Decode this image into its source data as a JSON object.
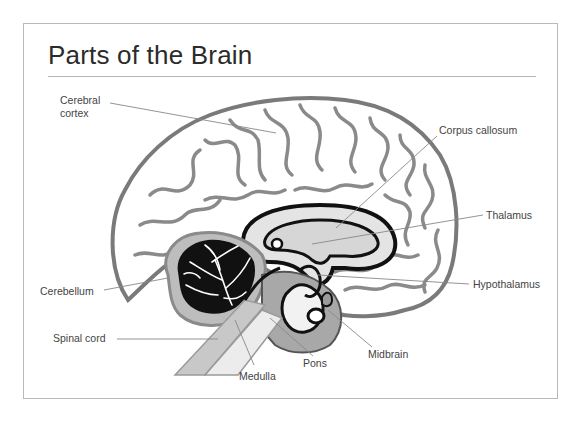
{
  "title": "Parts of the Brain",
  "labels": {
    "cerebral_cortex": "Cerebral\ncortex",
    "corpus_callosum": "Corpus callosum",
    "thalamus": "Thalamus",
    "cerebellum": "Cerebellum",
    "hypothalamus": "Hypothalamus",
    "spinal_cord": "Spinal cord",
    "midbrain": "Midbrain",
    "pons": "Pons",
    "medulla": "Medulla"
  },
  "colors": {
    "outline": "#7a7a7a",
    "dark": "#111111",
    "mid_gray": "#9a9a9a",
    "light_gray": "#cfcfcf",
    "leader_line": "#888888",
    "frame": "#b9b9b9"
  }
}
